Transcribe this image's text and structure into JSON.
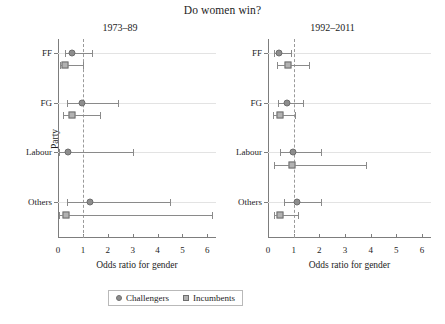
{
  "chart_data": {
    "type": "scatter",
    "title": "Do women win?",
    "xlabel": "Odds ratio for gender",
    "ylabel": "Party",
    "xlim": [
      0,
      6.35
    ],
    "xticks": [
      0,
      1,
      2,
      3,
      4,
      5,
      6
    ],
    "xticklabels": [
      "0",
      "1",
      "2",
      "3",
      "4",
      "5",
      "6"
    ],
    "categories": [
      "FF",
      "FG",
      "Labour",
      "Others"
    ],
    "reference_line": 1,
    "grid": "horizontal",
    "legend": {
      "position": "bottom-center",
      "entries": [
        {
          "label": "Challengers",
          "marker": "circle",
          "color": "#8d8d8d"
        },
        {
          "label": "Incumbents",
          "marker": "square",
          "color": "#b2b2b2"
        }
      ]
    },
    "panels": [
      {
        "title": "1973–89",
        "series": [
          {
            "name": "Challengers",
            "marker": "circle",
            "points": [
              {
                "category": "FF",
                "estimate": 0.58,
                "ci_low": 0.28,
                "ci_high": 1.38
              },
              {
                "category": "FG",
                "estimate": 0.95,
                "ci_low": 0.38,
                "ci_high": 2.42
              },
              {
                "category": "Labour",
                "estimate": 0.4,
                "ci_low": 0.05,
                "ci_high": 3.02
              },
              {
                "category": "Others",
                "estimate": 1.27,
                "ci_low": 0.35,
                "ci_high": 4.52
              }
            ]
          },
          {
            "name": "Incumbents",
            "marker": "square",
            "points": [
              {
                "category": "FF",
                "estimate": 0.3,
                "ci_low": 0.08,
                "ci_high": 1.0
              },
              {
                "category": "FG",
                "estimate": 0.58,
                "ci_low": 0.22,
                "ci_high": 1.7
              },
              {
                "category": "Labour",
                "estimate": null,
                "ci_low": null,
                "ci_high": null
              },
              {
                "category": "Others",
                "estimate": 0.32,
                "ci_low": 0.05,
                "ci_high": 6.2
              }
            ]
          }
        ]
      },
      {
        "title": "1992–2011",
        "series": [
          {
            "name": "Challengers",
            "marker": "circle",
            "points": [
              {
                "category": "FF",
                "estimate": 0.42,
                "ci_low": 0.25,
                "ci_high": 0.88
              },
              {
                "category": "FG",
                "estimate": 0.75,
                "ci_low": 0.38,
                "ci_high": 1.38
              },
              {
                "category": "Labour",
                "estimate": 0.98,
                "ci_low": 0.48,
                "ci_high": 2.08
              },
              {
                "category": "Others",
                "estimate": 1.12,
                "ci_low": 0.62,
                "ci_high": 2.08
              }
            ]
          },
          {
            "name": "Incumbents",
            "marker": "square",
            "points": [
              {
                "category": "FF",
                "estimate": 0.78,
                "ci_low": 0.35,
                "ci_high": 1.58
              },
              {
                "category": "FG",
                "estimate": 0.48,
                "ci_low": 0.2,
                "ci_high": 1.05
              },
              {
                "category": "Labour",
                "estimate": 0.95,
                "ci_low": 0.25,
                "ci_high": 3.82
              },
              {
                "category": "Others",
                "estimate": 0.48,
                "ci_low": 0.22,
                "ci_high": 1.18
              }
            ]
          }
        ]
      }
    ]
  }
}
